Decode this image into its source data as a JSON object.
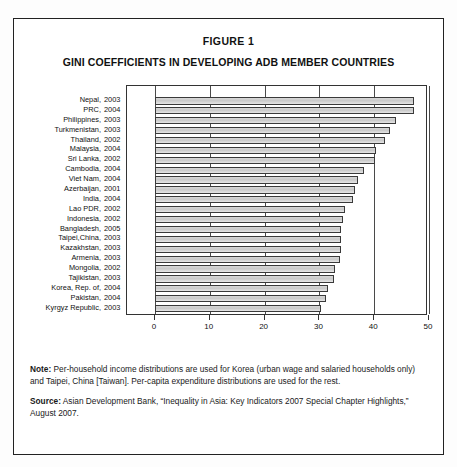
{
  "figure": {
    "label": "FIGURE 1",
    "title": "GINI COEFFICIENTS IN DEVELOPING ADB MEMBER COUNTRIES"
  },
  "notes": {
    "note_label": "Note:",
    "note_text": " Per-household income distributions are used for Korea (urban wage and salaried households only) and Taipei, China [Taiwan]. Per-capita expenditure distributions are used for the rest.",
    "source_label": "Source:",
    "source_text": " Asian Development Bank, “Inequality in Asia: Key Indicators 2007 Special Chapter Highlights,” August 2007."
  },
  "chart_data": {
    "type": "bar",
    "orientation": "horizontal",
    "title": "GINI COEFFICIENTS IN DEVELOPING ADB MEMBER COUNTRIES",
    "xlabel": "",
    "ylabel": "",
    "xlim": [
      0,
      50
    ],
    "xticks": [
      0,
      10,
      20,
      30,
      40,
      50
    ],
    "xtick_labels": [
      "0",
      "10",
      "20",
      "30",
      "40",
      "50"
    ],
    "grid": true,
    "legend": "none",
    "bar_color": "#d0d0d0",
    "bar_edge_color": "#3a3a3a",
    "categories": [
      "Nepal, 2003",
      "PRC, 2004",
      "Philippines, 2003",
      "Turkmenistan, 2003",
      "Thailand, 2002",
      "Malaysia, 2004",
      "Sri Lanka, 2002",
      "Cambodia, 2004",
      "Viet Nam, 2004",
      "Azerbaijan, 2001",
      "India, 2004",
      "Lao PDR, 2002",
      "Indonesia, 2002",
      "Bangladesh, 2005",
      "Taipei,China, 2003",
      "Kazakhstan, 2003",
      "Armenia, 2003",
      "Mongolia, 2002",
      "Tajikistan, 2003",
      "Korea, Rep. of, 2004",
      "Pakistan, 2004",
      "Kyrgyz Republic, 2003"
    ],
    "country_names": [
      "Nepal,",
      "PRC,",
      "Philippines,",
      "Turkmenistan,",
      "Thailand,",
      "Malaysia,",
      "Sri Lanka,",
      "Cambodia,",
      "Viet Nam,",
      "Azerbaijan,",
      "India,",
      "Lao PDR,",
      "Indonesia,",
      "Bangladesh,",
      "Taipei,China,",
      "Kazakhstan,",
      "Armenia,",
      "Mongolia,",
      "Tajikistan,",
      "Korea, Rep. of,",
      "Pakistan,",
      "Kyrgyz Republic,"
    ],
    "years": [
      "2003",
      "2004",
      "2003",
      "2003",
      "2002",
      "2004",
      "2002",
      "2004",
      "2004",
      "2001",
      "2004",
      "2002",
      "2002",
      "2005",
      "2003",
      "2003",
      "2003",
      "2002",
      "2003",
      "2004",
      "2004",
      "2003"
    ],
    "values": [
      47.3,
      47.2,
      44.0,
      42.8,
      42.0,
      40.3,
      40.2,
      38.1,
      37.1,
      36.5,
      36.2,
      34.7,
      34.3,
      34.0,
      33.9,
      33.9,
      33.8,
      32.8,
      32.6,
      31.6,
      31.2,
      30.3
    ]
  }
}
